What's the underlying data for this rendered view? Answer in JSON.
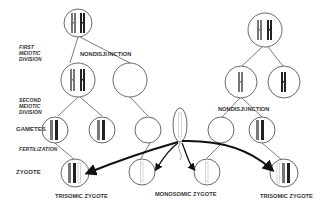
{
  "figure": {
    "stage_labels": {
      "first_meiotic_1": "FIRST",
      "first_meiotic_2": "MEIOTIC",
      "first_meiotic_3": "DIVISION",
      "second_meiotic_1": "SECOND",
      "second_meiotic_2": "MEIOTIC",
      "second_meiotic_3": "DIVISION",
      "gametes": "GAMETES",
      "fertilization": "FERTILIZATION",
      "zygote": "ZYGOTE"
    },
    "event_labels": {
      "left_nondisjunction": "NONDISJUNCTION",
      "right_nondisjunction": "NONDISJUNCTION"
    },
    "outcome_labels": {
      "left_trisomic": "TRISOMIC ZYGOTE",
      "monosomic": "MONOSOMIC ZYGOTE",
      "right_trisomic": "TRISOMIC ZYGOTE"
    },
    "colors": {
      "outline": "#444444",
      "chromosome_dark": "#222222",
      "chromosome_mid": "#777777",
      "chromosome_light": "#bbbbbb",
      "arrow": "#111111"
    }
  }
}
